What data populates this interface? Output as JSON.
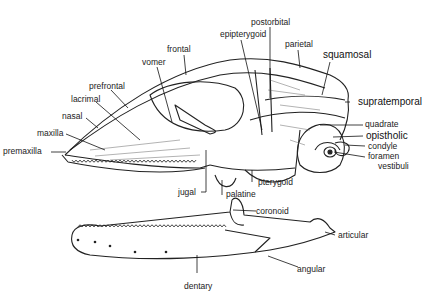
{
  "diagram": {
    "skull_labels": {
      "epipterygoid": "epipterygoid",
      "postorbital": "postorbital",
      "frontal": "frontal",
      "parietal": "parietal",
      "squamosal": "squamosal",
      "vomer": "vomer",
      "prefrontal": "prefrontal",
      "lacrimal": "lacrimal",
      "supratemporal": "supratemporal",
      "nasal": "nasal",
      "maxilla": "maxilla",
      "premaxilla": "premaxilla",
      "quadrate": "quadrate",
      "opistholic": "opistholic",
      "condyle": "condyle",
      "foramen": "foramen",
      "vestibuli": "vestibuli",
      "jugal": "jugal",
      "palatine": "palatine",
      "pterygoid": "pterygoid"
    },
    "jaw_labels": {
      "coronoid": "coronoid",
      "articular": "articular",
      "angular": "angular",
      "dentary": "dentary"
    }
  }
}
